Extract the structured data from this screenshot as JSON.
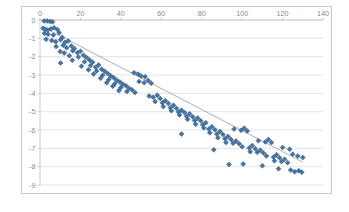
{
  "chart_data": {
    "type": "scatter",
    "title": "",
    "xlabel": "",
    "ylabel": "",
    "xlim": [
      0,
      140
    ],
    "ylim": [
      -9,
      0
    ],
    "xticks": [
      0,
      20,
      40,
      60,
      80,
      100,
      120,
      140
    ],
    "yticks": [
      0,
      -1,
      -2,
      -3,
      -4,
      -5,
      -6,
      -7,
      -8,
      -9
    ],
    "xtick_labels": [
      "0",
      "20",
      "40",
      "60",
      "80",
      "100",
      "120",
      "140"
    ],
    "ytick_labels": [
      "0",
      "-1",
      "-2",
      "-3",
      "-4",
      "-5",
      "-6",
      "-7",
      "-8",
      "-9"
    ],
    "grid": "horizontal",
    "legend": "none",
    "marker_shape": "diamond",
    "marker_color": "#4574a4",
    "marker_edge_color": "#31577e",
    "gridline_color": "#d8d8d8",
    "axis_color": "#b8b8b8",
    "tick_label_color": "#8a8a8a",
    "plot_background": "#ffffff",
    "border_color": "#c9c9c9",
    "xaxis_labels_position": "top",
    "trendline": {
      "visible": true,
      "color": "#9a9a9a",
      "type": "linear",
      "x_start": 1,
      "y_start": -0.35,
      "x_end": 130,
      "y_end": -7.75
    },
    "series": [
      {
        "name": "Series1",
        "points": [
          [
            2.0,
            -0.05
          ],
          [
            3.5,
            -0.05
          ],
          [
            5.0,
            -0.08
          ],
          [
            6.2,
            -0.1
          ],
          [
            1.5,
            -0.45
          ],
          [
            2.6,
            -0.5
          ],
          [
            3.8,
            -0.55
          ],
          [
            5.4,
            -0.48
          ],
          [
            7.0,
            -0.42
          ],
          [
            8.6,
            -0.52
          ],
          [
            2.2,
            -0.72
          ],
          [
            4.0,
            -0.78
          ],
          [
            6.6,
            -0.82
          ],
          [
            9.5,
            -0.7
          ],
          [
            11.0,
            -0.95
          ],
          [
            3.0,
            -1.05
          ],
          [
            5.8,
            -1.12
          ],
          [
            7.8,
            -1.18
          ],
          [
            10.2,
            -1.08
          ],
          [
            12.4,
            -1.22
          ],
          [
            14.0,
            -1.15
          ],
          [
            8.0,
            -1.45
          ],
          [
            11.5,
            -1.38
          ],
          [
            13.2,
            -1.52
          ],
          [
            15.5,
            -1.42
          ],
          [
            17.0,
            -1.55
          ],
          [
            10.0,
            -1.72
          ],
          [
            12.0,
            -1.8
          ],
          [
            16.2,
            -1.68
          ],
          [
            18.5,
            -1.78
          ],
          [
            20.0,
            -1.7
          ],
          [
            14.5,
            -1.95
          ],
          [
            19.0,
            -2.02
          ],
          [
            21.5,
            -1.92
          ],
          [
            23.0,
            -2.05
          ],
          [
            10.2,
            -2.35
          ],
          [
            16.0,
            -2.2
          ],
          [
            22.0,
            -2.28
          ],
          [
            24.5,
            -2.18
          ],
          [
            26.0,
            -2.3
          ],
          [
            20.5,
            -2.52
          ],
          [
            25.0,
            -2.48
          ],
          [
            27.5,
            -2.58
          ],
          [
            29.0,
            -2.45
          ],
          [
            24.0,
            -2.72
          ],
          [
            28.0,
            -2.78
          ],
          [
            30.5,
            -2.68
          ],
          [
            32.0,
            -2.8
          ],
          [
            26.5,
            -2.95
          ],
          [
            31.0,
            -3.02
          ],
          [
            33.5,
            -2.92
          ],
          [
            35.0,
            -3.05
          ],
          [
            30.0,
            -3.18
          ],
          [
            34.0,
            -3.25
          ],
          [
            36.5,
            -3.15
          ],
          [
            38.0,
            -3.28
          ],
          [
            33.0,
            -3.42
          ],
          [
            37.0,
            -3.48
          ],
          [
            39.5,
            -3.38
          ],
          [
            41.0,
            -3.5
          ],
          [
            36.0,
            -3.62
          ],
          [
            40.0,
            -3.68
          ],
          [
            42.5,
            -3.58
          ],
          [
            44.0,
            -3.72
          ],
          [
            39.0,
            -3.85
          ],
          [
            43.0,
            -3.9
          ],
          [
            45.5,
            -3.8
          ],
          [
            47.0,
            -3.95
          ],
          [
            46.5,
            -2.88
          ],
          [
            48.5,
            -2.95
          ],
          [
            50.0,
            -3.05
          ],
          [
            52.0,
            -3.1
          ],
          [
            49.0,
            -3.35
          ],
          [
            51.5,
            -3.42
          ],
          [
            53.5,
            -3.3
          ],
          [
            55.0,
            -3.45
          ],
          [
            54.0,
            -4.15
          ],
          [
            56.0,
            -4.22
          ],
          [
            58.0,
            -4.1
          ],
          [
            59.5,
            -4.28
          ],
          [
            57.0,
            -4.45
          ],
          [
            60.5,
            -4.52
          ],
          [
            62.0,
            -4.4
          ],
          [
            63.5,
            -4.55
          ],
          [
            61.0,
            -4.72
          ],
          [
            64.5,
            -4.78
          ],
          [
            66.0,
            -4.65
          ],
          [
            67.5,
            -4.82
          ],
          [
            65.0,
            -4.95
          ],
          [
            68.5,
            -5.02
          ],
          [
            70.0,
            -4.92
          ],
          [
            71.5,
            -5.05
          ],
          [
            69.0,
            -5.18
          ],
          [
            72.5,
            -5.25
          ],
          [
            74.0,
            -5.12
          ],
          [
            75.5,
            -5.28
          ],
          [
            73.0,
            -5.42
          ],
          [
            76.5,
            -5.48
          ],
          [
            78.0,
            -5.35
          ],
          [
            79.5,
            -5.5
          ],
          [
            70.0,
            -6.22
          ],
          [
            77.0,
            -5.68
          ],
          [
            80.5,
            -5.72
          ],
          [
            82.0,
            -5.6
          ],
          [
            81.0,
            -5.88
          ],
          [
            83.5,
            -5.95
          ],
          [
            85.0,
            -5.82
          ],
          [
            86.5,
            -5.98
          ],
          [
            84.0,
            -6.15
          ],
          [
            87.5,
            -6.22
          ],
          [
            89.0,
            -6.08
          ],
          [
            90.5,
            -6.25
          ],
          [
            88.0,
            -6.42
          ],
          [
            91.5,
            -6.48
          ],
          [
            93.0,
            -6.35
          ],
          [
            94.5,
            -6.52
          ],
          [
            92.0,
            -6.68
          ],
          [
            95.5,
            -6.72
          ],
          [
            97.0,
            -6.6
          ],
          [
            98.5,
            -6.75
          ],
          [
            96.0,
            -5.95
          ],
          [
            99.5,
            -6.02
          ],
          [
            101.0,
            -5.9
          ],
          [
            102.5,
            -6.05
          ],
          [
            100.0,
            -6.92
          ],
          [
            103.5,
            -6.98
          ],
          [
            105.0,
            -6.85
          ],
          [
            106.5,
            -7.02
          ],
          [
            104.0,
            -7.18
          ],
          [
            107.5,
            -7.22
          ],
          [
            109.0,
            -7.1
          ],
          [
            110.5,
            -7.25
          ],
          [
            108.0,
            -6.58
          ],
          [
            111.5,
            -6.65
          ],
          [
            113.0,
            -6.52
          ],
          [
            114.5,
            -6.68
          ],
          [
            112.0,
            -7.42
          ],
          [
            115.5,
            -7.48
          ],
          [
            117.0,
            -7.35
          ],
          [
            118.5,
            -7.52
          ],
          [
            116.0,
            -7.68
          ],
          [
            119.5,
            -7.72
          ],
          [
            121.0,
            -7.6
          ],
          [
            122.5,
            -7.78
          ],
          [
            100.5,
            -7.85
          ],
          [
            110.0,
            -7.95
          ],
          [
            120.0,
            -6.95
          ],
          [
            123.5,
            -7.05
          ],
          [
            124.0,
            -8.18
          ],
          [
            126.0,
            -8.28
          ],
          [
            128.0,
            -8.22
          ],
          [
            129.5,
            -8.3
          ],
          [
            125.0,
            -7.32
          ],
          [
            127.5,
            -7.42
          ],
          [
            130.0,
            -7.5
          ],
          [
            86.0,
            -7.08
          ],
          [
            93.5,
            -7.88
          ],
          [
            118.0,
            -8.12
          ]
        ]
      }
    ]
  }
}
